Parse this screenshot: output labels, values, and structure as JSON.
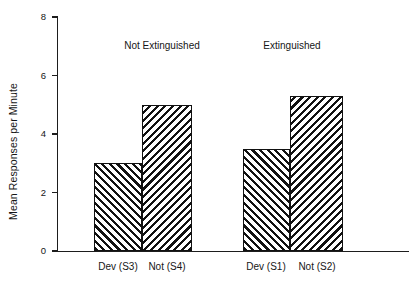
{
  "chart_data": {
    "type": "bar",
    "title": "",
    "subtitle": "",
    "xlabel": "",
    "ylabel": "Mean Responses per Minute",
    "categories": [
      "Dev (S3)",
      "Not (S4)",
      "Dev (S1)",
      "Not (S2)"
    ],
    "values": [
      3.0,
      5.0,
      3.5,
      5.3
    ],
    "series": [
      {
        "name": "Mean Responses per Minute",
        "values": [
          3.0,
          5.0,
          3.5,
          5.3
        ]
      }
    ],
    "bars": [
      {
        "category": "Dev (S3)",
        "value": 3.0,
        "group": "Not Extinguished",
        "hatch": "forward-diagonal"
      },
      {
        "category": "Not (S4)",
        "value": 5.0,
        "group": "Not Extinguished",
        "hatch": "backward-diagonal"
      },
      {
        "category": "Dev (S1)",
        "value": 3.5,
        "group": "Extinguished",
        "hatch": "forward-diagonal"
      },
      {
        "category": "Not (S2)",
        "value": 5.3,
        "group": "Extinguished",
        "hatch": "backward-diagonal"
      }
    ],
    "groups": [
      {
        "label": "Not Extinguished",
        "categories": [
          "Dev (S3)",
          "Not (S4)"
        ]
      },
      {
        "label": "Extinguished",
        "categories": [
          "Dev (S1)",
          "Not (S2)"
        ]
      }
    ],
    "ylim": [
      0,
      8
    ],
    "yticks": [
      0,
      2,
      4,
      6,
      8
    ],
    "ytick_labels": [
      "0",
      "2",
      "4",
      "6",
      "8"
    ],
    "xlim_categories": 4,
    "grid": false,
    "legend": false,
    "legend_position": "none",
    "bar_edge_color": "#111111",
    "bar_fill_color": "#ffffff",
    "axis_color": "#1d1d1d",
    "background_color": "#ffffff"
  },
  "axis": {
    "y_title": "Mean Responses per Minute",
    "ticks": [
      {
        "label": "8",
        "value": 8
      },
      {
        "label": "6",
        "value": 6
      },
      {
        "label": "4",
        "value": 4
      },
      {
        "label": "2",
        "value": 2
      },
      {
        "label": "0",
        "value": 0
      }
    ]
  },
  "groups": [
    {
      "label": "Not Extinguished"
    },
    {
      "label": "Extinguished"
    }
  ],
  "categories": [
    {
      "label": "Dev (S3)"
    },
    {
      "label": "Not (S4)"
    },
    {
      "label": "Dev (S1)"
    },
    {
      "label": "Not (S2)"
    }
  ]
}
